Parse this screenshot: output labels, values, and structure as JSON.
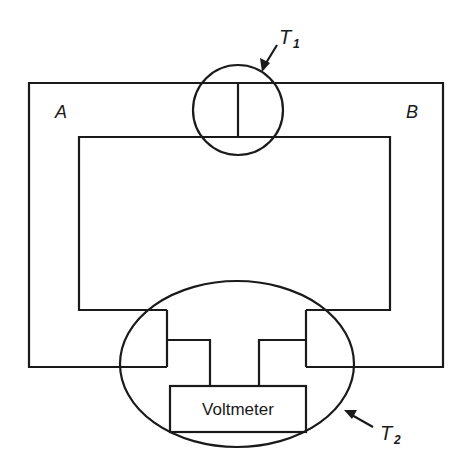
{
  "diagram": {
    "type": "thermocouple circuit",
    "labels": {
      "wire_a": "A",
      "wire_b": "B",
      "junction_1": "T",
      "junction_1_sub": "1",
      "junction_2": "T",
      "junction_2_sub": "2",
      "meter": "Voltmeter"
    },
    "colors": {
      "line": "#1a1a1a",
      "background": "#ffffff"
    }
  }
}
